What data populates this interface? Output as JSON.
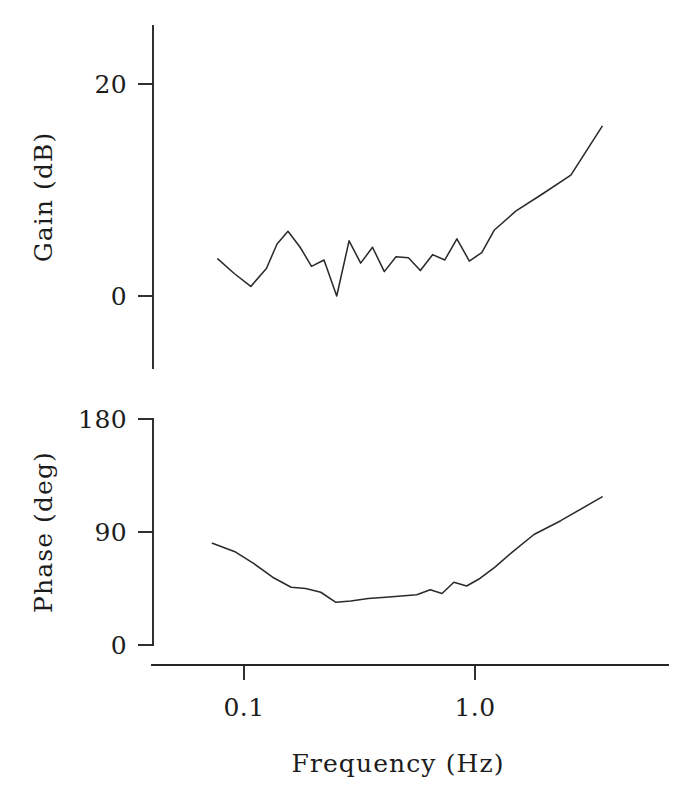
{
  "figure": {
    "kind": "bode-plot",
    "background_color": "#ffffff",
    "ink_color": "#262626"
  },
  "chart_data": [
    {
      "type": "line",
      "id": "gain-panel",
      "title": "",
      "xlabel": "",
      "ylabel": "Gain  (dB)",
      "xscale": "log",
      "xlim": [
        0.07,
        4.0
      ],
      "ylim": [
        -4,
        24
      ],
      "yticks": [
        0,
        20
      ],
      "ytick_labels": [
        "0",
        "20"
      ],
      "xticks": [
        0.1,
        1.0
      ],
      "xtick_labels": [
        "0.1",
        "1.0"
      ],
      "grid": false,
      "legend": "none",
      "series": [
        {
          "name": "Gain",
          "x": [
            0.077,
            0.091,
            0.107,
            0.125,
            0.139,
            0.155,
            0.175,
            0.196,
            0.222,
            0.252,
            0.285,
            0.32,
            0.36,
            0.405,
            0.455,
            0.515,
            0.58,
            0.655,
            0.74,
            0.835,
            0.945,
            1.07,
            1.21,
            1.5,
            1.95,
            2.6,
            3.55
          ],
          "y": [
            3.5,
            2.1,
            0.9,
            2.6,
            4.9,
            6.1,
            4.6,
            2.8,
            3.4,
            0.0,
            5.2,
            3.1,
            4.6,
            2.3,
            3.7,
            3.6,
            2.4,
            3.9,
            3.4,
            5.4,
            3.3,
            4.1,
            6.2,
            8.0,
            9.6,
            11.4,
            16.0
          ]
        }
      ]
    },
    {
      "type": "line",
      "id": "phase-panel",
      "title": "",
      "xlabel": "Frequency  (Hz)",
      "ylabel": "Phase  (deg)",
      "xscale": "log",
      "xlim": [
        0.07,
        4.0
      ],
      "ylim": [
        0,
        180
      ],
      "yticks": [
        0,
        90,
        180
      ],
      "ytick_labels": [
        "0",
        "90",
        "180"
      ],
      "xticks": [
        0.1,
        1.0
      ],
      "xtick_labels": [
        "0.1",
        "1.0"
      ],
      "grid": false,
      "legend": "none",
      "series": [
        {
          "name": "Phase",
          "x": [
            0.073,
            0.092,
            0.11,
            0.133,
            0.16,
            0.185,
            0.215,
            0.25,
            0.29,
            0.345,
            0.41,
            0.48,
            0.56,
            0.64,
            0.72,
            0.81,
            0.92,
            1.05,
            1.22,
            1.45,
            1.8,
            2.35,
            3.55
          ],
          "y": [
            81,
            74,
            65,
            54,
            46,
            45,
            42,
            34,
            35,
            37,
            38,
            39,
            40,
            44,
            41,
            50,
            47,
            53,
            62,
            74,
            88,
            99,
            118
          ]
        }
      ]
    }
  ],
  "labels": {
    "gain_axis_title": "Gain  (dB)",
    "phase_axis_title": "Phase  (deg)",
    "frequency_axis_title": "Frequency  (Hz)",
    "gain_tick_20": "20",
    "gain_tick_0": "0",
    "phase_tick_180": "180",
    "phase_tick_90": "90",
    "phase_tick_0": "0",
    "freq_tick_01": "0.1",
    "freq_tick_10": "1.0"
  }
}
